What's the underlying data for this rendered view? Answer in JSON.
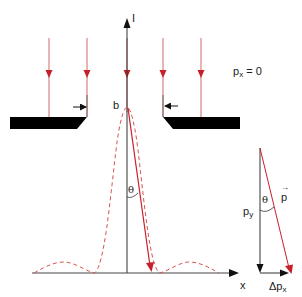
{
  "diagram": {
    "labels": {
      "intensity_axis": "I",
      "x_axis": "x",
      "slit_width": "b",
      "px_condition_main": "p",
      "px_condition_sub": "x",
      "px_condition_rest": " = 0",
      "theta_main": "θ",
      "theta_triangle": "θ",
      "py_main": "p",
      "py_sub": "y",
      "p_vector": "p",
      "dpx_main": "Δp",
      "dpx_sub": "x"
    },
    "colors": {
      "ray": "#c8202a",
      "ray_light": "#d9534f",
      "axis": "#222222",
      "plate": "#000000",
      "background": "#ffffff"
    },
    "incident_rays_x": [
      49,
      87,
      127,
      163,
      201
    ],
    "curve": {
      "type": "sinc-squared intensity",
      "style": "dashed"
    }
  }
}
